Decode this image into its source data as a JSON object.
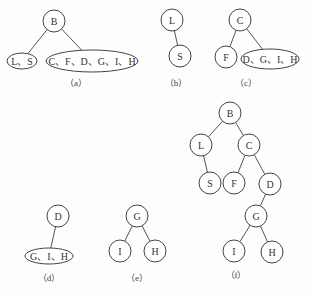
{
  "diagram": {
    "type": "binary-tree-construction",
    "stroke_color": "#444444",
    "background": "#ffffff",
    "panels": [
      {
        "id": "a",
        "caption": "（a）",
        "nodes": [
          {
            "id": "B",
            "label": "B",
            "shape": "circle",
            "x": 54,
            "y": 21,
            "r": 11
          },
          {
            "id": "LS",
            "label": "L、S",
            "shape": "ellipse",
            "x": 22,
            "y": 61,
            "rx": 15,
            "ry": 8
          },
          {
            "id": "CFDGIH",
            "label": "C、F、D、G、I、H",
            "shape": "ellipse",
            "x": 92,
            "y": 61,
            "rx": 46,
            "ry": 11
          }
        ],
        "edges": [
          [
            "B",
            "LS"
          ],
          [
            "B",
            "CFDGIH"
          ]
        ]
      },
      {
        "id": "b",
        "caption": "（b）",
        "nodes": [
          {
            "id": "L",
            "label": "L",
            "shape": "circle",
            "x": 172,
            "y": 20,
            "r": 11
          },
          {
            "id": "S",
            "label": "S",
            "shape": "circle",
            "x": 180,
            "y": 56,
            "r": 11
          }
        ],
        "edges": [
          [
            "L",
            "S"
          ]
        ]
      },
      {
        "id": "c",
        "caption": "（c）",
        "nodes": [
          {
            "id": "C",
            "label": "C",
            "shape": "circle",
            "x": 240,
            "y": 20,
            "r": 11
          },
          {
            "id": "F",
            "label": "F",
            "shape": "circle",
            "x": 226,
            "y": 57,
            "r": 11
          },
          {
            "id": "DGIH",
            "label": "D、G、I、H",
            "shape": "ellipse",
            "x": 270,
            "y": 59,
            "rx": 29,
            "ry": 10
          }
        ],
        "edges": [
          [
            "C",
            "F"
          ],
          [
            "C",
            "DGIH"
          ]
        ]
      },
      {
        "id": "d",
        "caption": "（d）",
        "nodes": [
          {
            "id": "D",
            "label": "D",
            "shape": "circle",
            "x": 58,
            "y": 216,
            "r": 11
          },
          {
            "id": "GIH",
            "label": "G、I、H",
            "shape": "ellipse",
            "x": 49,
            "y": 256,
            "rx": 24,
            "ry": 8
          }
        ],
        "edges": [
          [
            "D",
            "GIH"
          ]
        ]
      },
      {
        "id": "e",
        "caption": "（e）",
        "nodes": [
          {
            "id": "G",
            "label": "G",
            "shape": "circle",
            "x": 137,
            "y": 216,
            "r": 11
          },
          {
            "id": "I",
            "label": "I",
            "shape": "circle",
            "x": 120,
            "y": 251,
            "r": 11
          },
          {
            "id": "H",
            "label": "H",
            "shape": "circle",
            "x": 155,
            "y": 251,
            "r": 11
          }
        ],
        "edges": [
          [
            "G",
            "I"
          ],
          [
            "G",
            "H"
          ]
        ]
      },
      {
        "id": "f",
        "caption": "（f）",
        "nodes": [
          {
            "id": "B",
            "label": "B",
            "shape": "circle",
            "x": 230,
            "y": 113,
            "r": 11
          },
          {
            "id": "L",
            "label": "L",
            "shape": "circle",
            "x": 201,
            "y": 145,
            "r": 11
          },
          {
            "id": "C",
            "label": "C",
            "shape": "circle",
            "x": 249,
            "y": 145,
            "r": 11
          },
          {
            "id": "S",
            "label": "S",
            "shape": "circle",
            "x": 210,
            "y": 183,
            "r": 11
          },
          {
            "id": "F",
            "label": "F",
            "shape": "circle",
            "x": 234,
            "y": 183,
            "r": 11
          },
          {
            "id": "D",
            "label": "D",
            "shape": "circle",
            "x": 270,
            "y": 184,
            "r": 11
          },
          {
            "id": "G",
            "label": "G",
            "shape": "circle",
            "x": 256,
            "y": 216,
            "r": 11
          },
          {
            "id": "I",
            "label": "I",
            "shape": "circle",
            "x": 234,
            "y": 251,
            "r": 11
          },
          {
            "id": "H",
            "label": "H",
            "shape": "circle",
            "x": 272,
            "y": 252,
            "r": 11
          }
        ],
        "edges": [
          [
            "B",
            "L"
          ],
          [
            "B",
            "C"
          ],
          [
            "L",
            "S"
          ],
          [
            "C",
            "F"
          ],
          [
            "C",
            "D"
          ],
          [
            "D",
            "G"
          ],
          [
            "G",
            "I"
          ],
          [
            "G",
            "H"
          ]
        ]
      }
    ],
    "captions_pos": {
      "a": {
        "x": 76,
        "y": 86
      },
      "b": {
        "x": 176,
        "y": 86
      },
      "c": {
        "x": 246,
        "y": 86
      },
      "d": {
        "x": 49,
        "y": 281
      },
      "e": {
        "x": 137,
        "y": 281
      },
      "f": {
        "x": 236,
        "y": 278
      }
    }
  }
}
